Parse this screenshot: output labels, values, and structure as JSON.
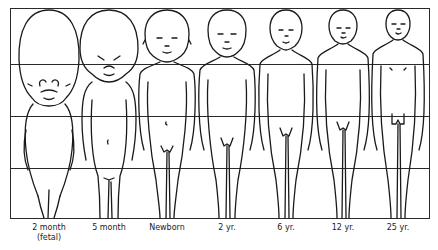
{
  "diagram": {
    "type": "body-proportion-comparison",
    "grid": {
      "horizontal_divisions": 4,
      "line_color": "#333333"
    },
    "figures": [
      {
        "id": "fig-2-month",
        "label": "2 month",
        "sublabel": "(fetal)",
        "cx": 49
      },
      {
        "id": "fig-5-month",
        "label": "5 month",
        "sublabel": "",
        "cx": 109
      },
      {
        "id": "fig-newborn",
        "label": "Newborn",
        "sublabel": "",
        "cx": 167
      },
      {
        "id": "fig-2-yr",
        "label": "2 yr.",
        "sublabel": "",
        "cx": 227
      },
      {
        "id": "fig-6-yr",
        "label": "6 yr.",
        "sublabel": "",
        "cx": 286
      },
      {
        "id": "fig-12-yr",
        "label": "12 yr.",
        "sublabel": "",
        "cx": 343
      },
      {
        "id": "fig-25-yr",
        "label": "25 yr.",
        "sublabel": "",
        "cx": 398
      }
    ]
  }
}
